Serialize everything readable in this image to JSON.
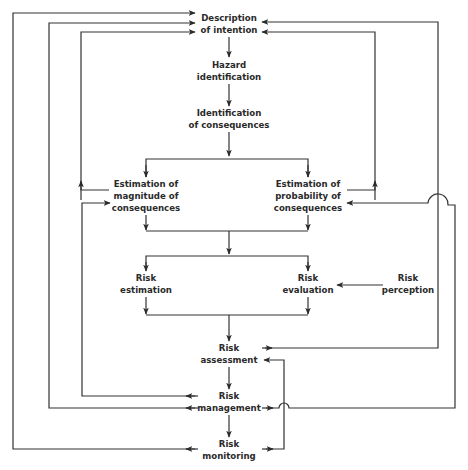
{
  "diagram": {
    "type": "risk-management-flowchart",
    "line_color": "#333333",
    "text_color": "#2a2a2a",
    "background": "#ffffff",
    "nodes": {
      "description": {
        "line1": "Description",
        "line2": "of intention"
      },
      "hazard": {
        "line1": "Hazard",
        "line2": "identification"
      },
      "identification": {
        "line1": "Identification",
        "line2": "of consequences"
      },
      "magnitude": {
        "line1": "Estimation of",
        "line2": "magnitude of",
        "line3": "consequences"
      },
      "probability": {
        "line1": "Estimation of",
        "line2": "probability of",
        "line3": "consequences"
      },
      "risk_estimation": {
        "line1": "Risk",
        "line2": "estimation"
      },
      "risk_evaluation": {
        "line1": "Risk",
        "line2": "evaluation"
      },
      "risk_perception": {
        "line1": "Risk",
        "line2": "perception"
      },
      "risk_assessment": {
        "line1": "Risk",
        "line2": "assessment"
      },
      "risk_management": {
        "line1": "Risk",
        "line2": "management"
      },
      "risk_monitoring": {
        "line1": "Risk",
        "line2": "monitoring"
      }
    },
    "edges": [
      {
        "from": "Description of intention",
        "to": "Hazard identification"
      },
      {
        "from": "Hazard identification",
        "to": "Identification of consequences"
      },
      {
        "from": "Identification of consequences",
        "to": "Estimation of magnitude of consequences"
      },
      {
        "from": "Identification of consequences",
        "to": "Estimation of probability of consequences"
      },
      {
        "from": "Estimation of magnitude of consequences",
        "to": "Description of intention",
        "kind": "feedback"
      },
      {
        "from": "Estimation of probability of consequences",
        "to": "Description of intention",
        "kind": "feedback"
      },
      {
        "from": "Estimation of magnitude of consequences",
        "to": "Risk estimation"
      },
      {
        "from": "Estimation of probability of consequences",
        "to": "Risk evaluation"
      },
      {
        "from": "Risk perception",
        "to": "Risk evaluation"
      },
      {
        "from": "Risk estimation",
        "to": "Risk assessment"
      },
      {
        "from": "Risk evaluation",
        "to": "Risk assessment"
      },
      {
        "from": "Risk assessment",
        "to": "Description of intention",
        "kind": "feedback"
      },
      {
        "from": "Risk assessment",
        "to": "Risk management"
      },
      {
        "from": "Risk management",
        "to": "Estimation of magnitude of consequences",
        "kind": "feedback"
      },
      {
        "from": "Risk management",
        "to": "Description of intention",
        "kind": "feedback"
      },
      {
        "from": "Risk management",
        "to": "Estimation of probability of consequences",
        "kind": "feedback"
      },
      {
        "from": "Risk management",
        "to": "Risk monitoring"
      },
      {
        "from": "Risk monitoring",
        "to": "Description of intention",
        "kind": "feedback"
      },
      {
        "from": "Risk monitoring",
        "to": "Risk assessment",
        "kind": "feedback"
      }
    ]
  }
}
